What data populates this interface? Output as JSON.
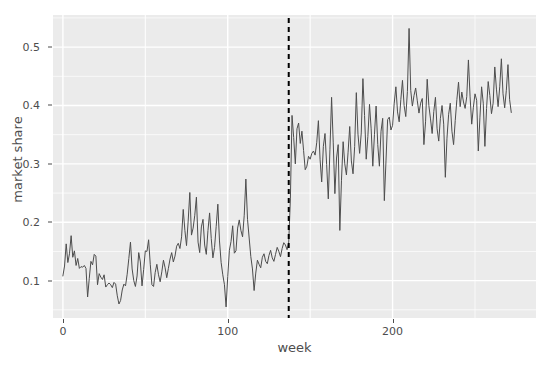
{
  "chart_data": {
    "type": "line",
    "title": "",
    "xlabel": "week",
    "ylabel": "market share",
    "xlim": [
      -6,
      287
    ],
    "ylim": [
      0.036,
      0.555
    ],
    "grid": true,
    "legend": "none",
    "line_color": "#4d4d4d",
    "panel_color": "#ebebeb",
    "gridline_color": "#ffffff",
    "xticks": [
      0,
      100,
      200
    ],
    "xtick_labels": [
      "0",
      "100",
      "200"
    ],
    "yticks": [
      0.1,
      0.2,
      0.3,
      0.4,
      0.5
    ],
    "ytick_labels": [
      "0.1",
      "0.2",
      "0.3",
      "0.4",
      "0.5"
    ],
    "annotations": [
      {
        "name": "intervention-line",
        "type": "vline",
        "x": 137,
        "style": "dashed",
        "color": "#000000",
        "width": 2
      }
    ],
    "series": [
      {
        "name": "market share",
        "x_start": 0,
        "x_step": 1,
        "values": [
          0.108,
          0.125,
          0.163,
          0.131,
          0.146,
          0.177,
          0.14,
          0.151,
          0.126,
          0.138,
          0.121,
          0.124,
          0.123,
          0.126,
          0.121,
          0.072,
          0.104,
          0.133,
          0.127,
          0.145,
          0.142,
          0.093,
          0.112,
          0.106,
          0.102,
          0.11,
          0.089,
          0.093,
          0.096,
          0.093,
          0.088,
          0.097,
          0.094,
          0.074,
          0.06,
          0.066,
          0.084,
          0.094,
          0.091,
          0.111,
          0.138,
          0.166,
          0.12,
          0.1,
          0.09,
          0.108,
          0.148,
          0.132,
          0.091,
          0.119,
          0.151,
          0.15,
          0.17,
          0.128,
          0.093,
          0.09,
          0.114,
          0.128,
          0.11,
          0.098,
          0.115,
          0.135,
          0.122,
          0.105,
          0.121,
          0.137,
          0.148,
          0.132,
          0.142,
          0.159,
          0.164,
          0.155,
          0.175,
          0.222,
          0.186,
          0.16,
          0.202,
          0.251,
          0.178,
          0.19,
          0.212,
          0.243,
          0.166,
          0.148,
          0.192,
          0.205,
          0.161,
          0.145,
          0.186,
          0.216,
          0.172,
          0.139,
          0.157,
          0.193,
          0.231,
          0.168,
          0.131,
          0.11,
          0.093,
          0.055,
          0.107,
          0.152,
          0.167,
          0.194,
          0.147,
          0.151,
          0.19,
          0.204,
          0.186,
          0.175,
          0.212,
          0.274,
          0.205,
          0.173,
          0.141,
          0.12,
          0.083,
          0.113,
          0.135,
          0.128,
          0.122,
          0.14,
          0.146,
          0.133,
          0.129,
          0.143,
          0.152,
          0.139,
          0.133,
          0.145,
          0.157,
          0.15,
          0.141,
          0.155,
          0.165,
          0.161,
          0.153,
          0.166,
          0.24,
          0.383,
          0.345,
          0.3,
          0.36,
          0.37,
          0.335,
          0.356,
          0.323,
          0.29,
          0.296,
          0.313,
          0.308,
          0.318,
          0.322,
          0.315,
          0.337,
          0.374,
          0.308,
          0.269,
          0.33,
          0.352,
          0.299,
          0.24,
          0.325,
          0.414,
          0.336,
          0.249,
          0.31,
          0.333,
          0.186,
          0.272,
          0.338,
          0.3,
          0.281,
          0.32,
          0.364,
          0.305,
          0.283,
          0.33,
          0.422,
          0.351,
          0.318,
          0.353,
          0.446,
          0.383,
          0.308,
          0.347,
          0.402,
          0.36,
          0.296,
          0.35,
          0.399,
          0.333,
          0.296,
          0.356,
          0.378,
          0.237,
          0.305,
          0.376,
          0.38,
          0.358,
          0.366,
          0.404,
          0.432,
          0.389,
          0.372,
          0.41,
          0.443,
          0.4,
          0.381,
          0.424,
          0.532,
          0.426,
          0.399,
          0.417,
          0.43,
          0.408,
          0.387,
          0.404,
          0.412,
          0.333,
          0.372,
          0.445,
          0.4,
          0.377,
          0.352,
          0.39,
          0.414,
          0.36,
          0.339,
          0.378,
          0.4,
          0.368,
          0.277,
          0.344,
          0.385,
          0.404,
          0.356,
          0.333,
          0.374,
          0.41,
          0.44,
          0.398,
          0.423,
          0.406,
          0.395,
          0.415,
          0.478,
          0.416,
          0.368,
          0.397,
          0.42,
          0.409,
          0.322,
          0.38,
          0.432,
          0.404,
          0.33,
          0.395,
          0.441,
          0.417,
          0.386,
          0.404,
          0.466,
          0.428,
          0.398,
          0.432,
          0.48,
          0.42,
          0.396,
          0.426,
          0.47,
          0.41,
          0.388
        ]
      }
    ]
  }
}
